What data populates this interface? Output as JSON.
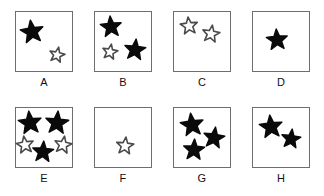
{
  "figure": {
    "type": "star-count-panel-grid",
    "background_color": "#ffffff",
    "box_border_color": "#6e6e6e",
    "filled_star_color": "#0a0a0a",
    "outline_star_color": "#4a4a4a",
    "rows": 2,
    "columns": 4
  },
  "panels": [
    {
      "label": "A",
      "box": {
        "x": 15,
        "y": 11,
        "w": 58,
        "h": 61
      },
      "label_pos": {
        "y": 76
      },
      "filled_count": 1,
      "outline_count": 1,
      "total_count": 2,
      "stars": [
        {
          "type": "filled",
          "cx": 32,
          "cy": 32,
          "r": 12,
          "rot": -8
        },
        {
          "type": "outline",
          "cx": 57,
          "cy": 55,
          "r": 8,
          "rot": 12
        }
      ]
    },
    {
      "label": "B",
      "box": {
        "x": 94,
        "y": 11,
        "w": 58,
        "h": 61
      },
      "label_pos": {
        "y": 76
      },
      "filled_count": 2,
      "outline_count": 1,
      "total_count": 3,
      "stars": [
        {
          "type": "filled",
          "cx": 111,
          "cy": 27,
          "r": 11,
          "rot": -5
        },
        {
          "type": "outline",
          "cx": 110,
          "cy": 52,
          "r": 8,
          "rot": 10
        },
        {
          "type": "filled",
          "cx": 135,
          "cy": 50,
          "r": 11,
          "rot": 6
        }
      ]
    },
    {
      "label": "C",
      "box": {
        "x": 173,
        "y": 11,
        "w": 58,
        "h": 61
      },
      "label_pos": {
        "y": 76
      },
      "filled_count": 0,
      "outline_count": 2,
      "total_count": 2,
      "stars": [
        {
          "type": "outline",
          "cx": 189,
          "cy": 26,
          "r": 9,
          "rot": -6
        },
        {
          "type": "outline",
          "cx": 211,
          "cy": 34,
          "r": 9,
          "rot": 9
        }
      ]
    },
    {
      "label": "D",
      "box": {
        "x": 252,
        "y": 11,
        "w": 58,
        "h": 61
      },
      "label_pos": {
        "y": 76
      },
      "filled_count": 1,
      "outline_count": 0,
      "total_count": 1,
      "stars": [
        {
          "type": "filled",
          "cx": 277,
          "cy": 40,
          "r": 11,
          "rot": -4
        }
      ]
    },
    {
      "label": "E",
      "box": {
        "x": 15,
        "y": 107,
        "w": 58,
        "h": 61
      },
      "label_pos": {
        "y": 172
      },
      "filled_count": 3,
      "outline_count": 2,
      "total_count": 5,
      "stars": [
        {
          "type": "filled",
          "cx": 30,
          "cy": 123,
          "r": 12,
          "rot": -6
        },
        {
          "type": "filled",
          "cx": 57,
          "cy": 123,
          "r": 12,
          "rot": 5
        },
        {
          "type": "outline",
          "cx": 25,
          "cy": 145,
          "r": 9,
          "rot": -8
        },
        {
          "type": "filled",
          "cx": 43,
          "cy": 152,
          "r": 11,
          "rot": 4
        },
        {
          "type": "outline",
          "cx": 63,
          "cy": 145,
          "r": 9,
          "rot": 10
        }
      ]
    },
    {
      "label": "F",
      "box": {
        "x": 94,
        "y": 107,
        "w": 58,
        "h": 61
      },
      "label_pos": {
        "y": 172
      },
      "filled_count": 0,
      "outline_count": 1,
      "total_count": 1,
      "stars": [
        {
          "type": "outline",
          "cx": 125,
          "cy": 146,
          "r": 9,
          "rot": 6
        }
      ]
    },
    {
      "label": "G",
      "box": {
        "x": 173,
        "y": 107,
        "w": 58,
        "h": 61
      },
      "label_pos": {
        "y": 172
      },
      "filled_count": 3,
      "outline_count": 0,
      "total_count": 3,
      "stars": [
        {
          "type": "filled",
          "cx": 192,
          "cy": 125,
          "r": 12,
          "rot": -7
        },
        {
          "type": "filled",
          "cx": 214,
          "cy": 138,
          "r": 11,
          "rot": 8
        },
        {
          "type": "filled",
          "cx": 194,
          "cy": 150,
          "r": 11,
          "rot": 3
        }
      ]
    },
    {
      "label": "H",
      "box": {
        "x": 252,
        "y": 107,
        "w": 58,
        "h": 61
      },
      "label_pos": {
        "y": 172
      },
      "filled_count": 2,
      "outline_count": 0,
      "total_count": 2,
      "stars": [
        {
          "type": "filled",
          "cx": 271,
          "cy": 127,
          "r": 12,
          "rot": -6
        },
        {
          "type": "filled",
          "cx": 291,
          "cy": 139,
          "r": 10,
          "rot": 7
        }
      ]
    }
  ]
}
